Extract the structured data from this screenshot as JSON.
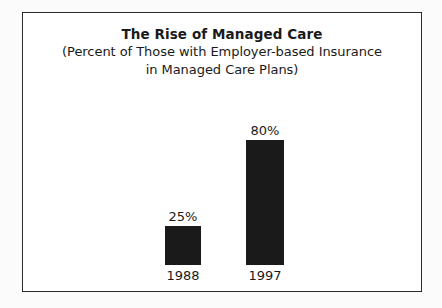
{
  "chart_data": {
    "type": "bar",
    "title": "The Rise of Managed Care",
    "subtitle_lines": [
      "(Percent of Those with Employer-based Insurance",
      "in Managed Care Plans)"
    ],
    "categories": [
      "1988",
      "1997"
    ],
    "values": [
      25,
      80
    ],
    "value_labels": [
      "25%",
      "80%"
    ],
    "xlabel": "",
    "ylabel": "",
    "ylim": [
      0,
      100
    ],
    "grid": false,
    "legend": false,
    "bar_color": "#1a1a1a",
    "background_color": "#ffffff",
    "border_color": "#2b2b2b"
  }
}
